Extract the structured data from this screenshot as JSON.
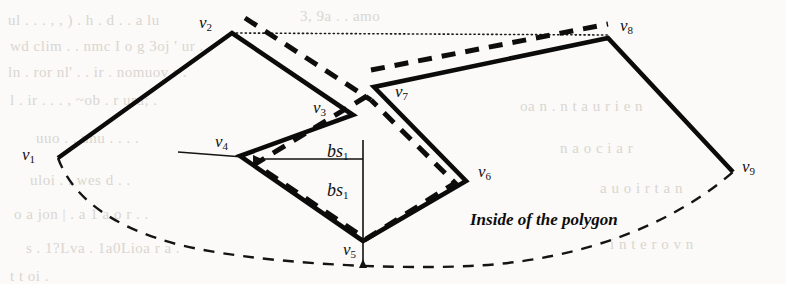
{
  "figure": {
    "caption": "Inside of the polygon",
    "background_color": "#fbfaf8",
    "ink_color": "#111111",
    "vertices": [
      {
        "id": "v1",
        "label": "v",
        "sub": "1",
        "x": 58,
        "y": 158,
        "label_x": 22,
        "label_y": 146
      },
      {
        "id": "v2",
        "label": "v",
        "sub": "2",
        "x": 232,
        "y": 33,
        "label_x": 199,
        "label_y": 14
      },
      {
        "id": "v3",
        "label": "v",
        "sub": "3",
        "x": 353,
        "y": 115,
        "label_x": 313,
        "label_y": 99
      },
      {
        "id": "v4",
        "label": "v",
        "sub": "4",
        "x": 240,
        "y": 156,
        "label_x": 215,
        "label_y": 133
      },
      {
        "id": "v5",
        "label": "v",
        "sub": "5",
        "x": 363,
        "y": 241,
        "label_x": 343,
        "label_y": 241
      },
      {
        "id": "v6",
        "label": "v",
        "sub": "6",
        "x": 466,
        "y": 181,
        "label_x": 478,
        "label_y": 163
      },
      {
        "id": "v7",
        "label": "v",
        "sub": "7",
        "x": 374,
        "y": 87,
        "label_x": 395,
        "label_y": 83
      },
      {
        "id": "v8",
        "label": "v",
        "sub": "8",
        "x": 608,
        "y": 38,
        "label_x": 620,
        "label_y": 17
      },
      {
        "id": "v9",
        "label": "v",
        "sub": "9",
        "x": 733,
        "y": 172,
        "label_x": 742,
        "label_y": 158
      }
    ],
    "bisector_labels": [
      {
        "id": "bs1-horizontal",
        "label": "bs",
        "sub": "1",
        "label_x": 327,
        "label_y": 142
      },
      {
        "id": "bs1-vertical",
        "label": "bs",
        "sub": "1",
        "label_x": 327,
        "label_y": 181
      }
    ],
    "caption_x": 470,
    "caption_y": 210,
    "paths": {
      "solid_boundary": "M 58,158 L 232,33 L 353,115 L 240,156 L 363,241 L 466,181 L 374,87 L 608,38 L 733,172",
      "dashed_boundary": "M 58,158 C 72,196 110,227 180,245 C 250,262 380,270 470,266 C 560,262 660,235 733,172",
      "dotted_sightline": "M 232,33 L 608,35",
      "dashed_offset_upper": "M 245,18 L 371,100",
      "dashed_offset_top": "M 371,70 L 608,24",
      "dashed_offset_inner": "M 367,96 L 255,164 L 366,239 L 455,183 L 371,100",
      "bisector_arrow_horizontal": "M 363,159 L 253,159",
      "bisector_arrow_vertical": "M 363,140 L 363,268",
      "v4_tangent": "M 178,152 L 243,157"
    },
    "ghost_text": [
      {
        "text": "ul .  . .  ,  ,  ) .  h .  d .  .   a  lu",
        "x": 8,
        "y": 12
      },
      {
        "text": "3, 9a .  . amo",
        "x": 300,
        "y": 8
      },
      {
        "text": "wd clim .  .  nmc I o g 3oj  ' ur .",
        "x": 10,
        "y": 38
      },
      {
        "text": "ln .  ror  nl' .  .  ir  . nomuov r .",
        "x": 8,
        "y": 64
      },
      {
        "text": "l  .   ir .  .  . ,  ~ob .  r  uru; .",
        "x": 10,
        "y": 92
      },
      {
        "text": "uuo .   .  unu .  .  .  .",
        "x": 36,
        "y": 130
      },
      {
        "text": "uloi .  .  wes d .  .",
        "x": 30,
        "y": 172
      },
      {
        "text": "o  a  jon  |  .  a  1  a  o  r  .  .",
        "x": 14,
        "y": 206
      },
      {
        "text": "s  .  1?Lva .  1a0Lioa r a .",
        "x": 26,
        "y": 240
      },
      {
        "text": "t t   oi .",
        "x": 10,
        "y": 268
      },
      {
        "text": "oa  n .  n t  a  u  r  i  e   n",
        "x": 520,
        "y": 98
      },
      {
        "text": "n  a  o  c   i    a     r",
        "x": 560,
        "y": 140
      },
      {
        "text": "a   u o   i r  t a  n",
        "x": 600,
        "y": 180
      },
      {
        "text": "i n t   e r  o  v  n",
        "x": 610,
        "y": 236
      }
    ]
  }
}
